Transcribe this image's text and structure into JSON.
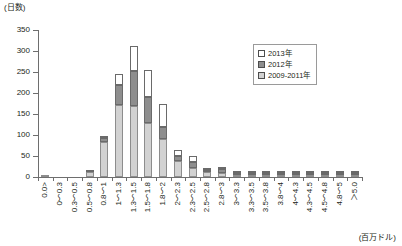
{
  "chart_data": {
    "type": "bar",
    "stacked": true,
    "title": "",
    "ylabel": "(日数)",
    "xlabel": "(百万ドル)",
    "ylim": [
      0,
      350
    ],
    "yticks": [
      0,
      50,
      100,
      150,
      200,
      250,
      300,
      350
    ],
    "grid": false,
    "legend_position": "top-right",
    "categories": [
      "0.0>",
      "0〜0.3",
      "0.3〜0.5",
      "0.5〜0.8",
      "0.8〜1",
      "1〜1.3",
      "1.3〜1.5",
      "1.5〜1.8",
      "1.8〜2",
      "2〜2.3",
      "2.3〜2.5",
      "2.5〜2.8",
      "2.8〜3",
      "3〜3.3",
      "3.3〜3.5",
      "3.5〜3.8",
      "3.8〜4",
      "4〜4.3",
      "4.3〜4.5",
      "4.5〜4.8",
      "4.8〜5",
      "＞5.0"
    ],
    "series": [
      {
        "name": "2009-2011年",
        "color": "#d2d2d2",
        "values": [
          2,
          0,
          0,
          13,
          84,
          172,
          168,
          128,
          90,
          38,
          22,
          12,
          10,
          2,
          2,
          2,
          1,
          2,
          1,
          1,
          1,
          1
        ]
      },
      {
        "name": "2012年",
        "color": "#8e8e8e",
        "values": [
          0,
          0,
          0,
          2,
          10,
          47,
          84,
          62,
          30,
          12,
          14,
          4,
          8,
          1,
          1,
          1,
          1,
          1,
          1,
          1,
          1,
          1
        ]
      },
      {
        "name": "2013年",
        "color": "#ffffff",
        "values": [
          0,
          0,
          0,
          0,
          4,
          27,
          61,
          65,
          55,
          15,
          14,
          2,
          2,
          1,
          1,
          1,
          1,
          1,
          1,
          1,
          1,
          1
        ]
      }
    ],
    "totals": [
      2,
      0,
      0,
      15,
      98,
      246,
      313,
      255,
      175,
      65,
      50,
      18,
      20,
      4,
      4,
      4,
      3,
      4,
      3,
      3,
      3,
      3
    ]
  },
  "legend": {
    "items": [
      {
        "label": "2013年",
        "swatch": "white"
      },
      {
        "label": "2012年",
        "swatch": "dark-gray"
      },
      {
        "label": "2009-2011年",
        "swatch": "light-gray"
      }
    ]
  }
}
